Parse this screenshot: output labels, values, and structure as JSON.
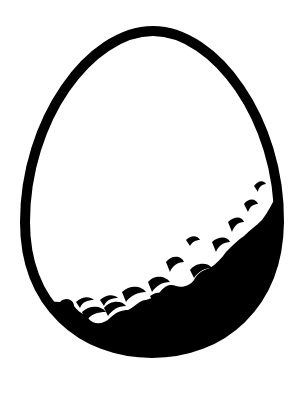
{
  "illustration": {
    "subject": "egg",
    "description": "Black-outlined egg with a black lower section separated by a scalloped white wave edge",
    "icon": "egg-icon",
    "colors": {
      "background": "#ffffff",
      "outline": "#000000",
      "fill_top": "#ffffff",
      "fill_bottom": "#000000"
    }
  }
}
